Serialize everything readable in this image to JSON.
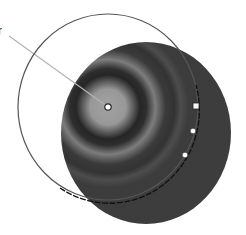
{
  "diagram": {
    "type": "radial-gradient-editor",
    "callout_label": "r",
    "gradient": {
      "shape": "ellipse",
      "fill_center": [
        146,
        133
      ],
      "fill_radii": [
        85,
        91
      ],
      "focal_point": [
        108,
        107
      ],
      "stops": [
        {
          "offset": 0.0,
          "color": "#a2a2a2"
        },
        {
          "offset": 0.18,
          "color": "#979797"
        },
        {
          "offset": 0.27,
          "color": "#262626"
        },
        {
          "offset": 0.36,
          "color": "#303030"
        },
        {
          "offset": 0.47,
          "color": "#7d7d7d"
        },
        {
          "offset": 0.58,
          "color": "#383838"
        },
        {
          "offset": 0.72,
          "color": "#4a4a4a"
        },
        {
          "offset": 0.8,
          "color": "#3b3b3b"
        },
        {
          "offset": 1.0,
          "color": "#3d3d3d"
        }
      ]
    },
    "outline_circle": {
      "center": [
        108,
        107
      ],
      "radii": [
        90,
        93
      ],
      "color": "#555555"
    },
    "center_handle": {
      "x": 108,
      "y": 107,
      "shape": "circle"
    },
    "edge_handles": [
      {
        "x": 196,
        "y": 106,
        "shape": "square"
      },
      {
        "x": 193,
        "y": 131,
        "shape": "circle"
      },
      {
        "x": 185,
        "y": 155,
        "shape": "circle"
      }
    ],
    "leader_line": {
      "from": [
        9,
        36
      ],
      "to": [
        108,
        107
      ],
      "color": "#b4b4b4"
    }
  }
}
